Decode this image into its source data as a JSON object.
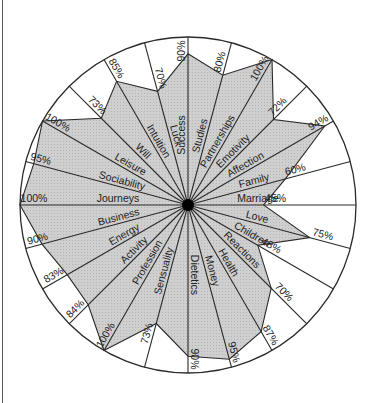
{
  "chart_data": {
    "type": "radar",
    "title": "",
    "center": [
      188,
      205
    ],
    "radius": 168,
    "start_angle_deg": 90,
    "direction": "clockwise",
    "grid": false,
    "fill_color": "#c8c8c8",
    "line_color": "#2a2a2a",
    "center_dot_color": "#000000",
    "categories": [
      "Success",
      "Studies",
      "Partnerships",
      "Emotivity",
      "Affection",
      "Family",
      "Marriage",
      "Love",
      "Children",
      "Reactions",
      "Health",
      "Money",
      "Dietetics",
      "Sensuality",
      "Profession",
      "Activity",
      "Energy",
      "Business",
      "Journeys",
      "Sociability",
      "Leisure",
      "Will",
      "Intuition",
      "Luck"
    ],
    "values": [
      90,
      80,
      100,
      72,
      94,
      60,
      45,
      75,
      48,
      70,
      87,
      95,
      90,
      73,
      100,
      84,
      83,
      90,
      100,
      95,
      100,
      73,
      85,
      70
    ],
    "value_labels": [
      "90%",
      "80%",
      "100%",
      "72%",
      "94%",
      "60%",
      "45%",
      "75%",
      "48%",
      "70%",
      "87%",
      "95%",
      "90%",
      "73%",
      "100%",
      "84%",
      "83%",
      "90%",
      "100%",
      "95%",
      "100%",
      "73%",
      "85%",
      "70%"
    ],
    "ylim": [
      0,
      100
    ],
    "unit": "%"
  }
}
